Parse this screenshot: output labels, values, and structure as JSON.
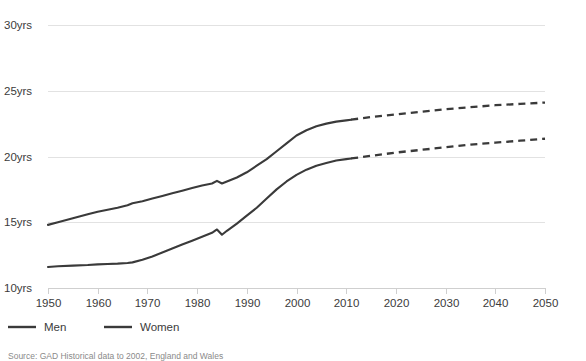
{
  "chart_data": {
    "type": "line",
    "title": "",
    "subtitle": "",
    "xlabel": "",
    "ylabel": "",
    "xlim": [
      1950,
      2050
    ],
    "ylim": [
      10,
      30
    ],
    "grid": true,
    "legend_position": "bottom-left",
    "y_tick_labels": [
      "10yrs",
      "15yrs",
      "20yrs",
      "25yrs",
      "30yrs"
    ],
    "y_ticks": [
      10,
      15,
      20,
      25,
      30
    ],
    "x_tick_labels": [
      "1950",
      "1960",
      "1970",
      "1980",
      "1990",
      "2000",
      "2010",
      "2020",
      "2030",
      "2040",
      "2050"
    ],
    "x_ticks": [
      1950,
      1960,
      1970,
      1980,
      1990,
      2000,
      2010,
      2020,
      2030,
      2040,
      2050
    ],
    "projection_start_year": 2011,
    "line_color": "#3a3a3a",
    "grid_color": "#e2e2e2",
    "series": [
      {
        "name": "Men",
        "style": "solid-then-dashed",
        "x": [
          1950,
          1952,
          1955,
          1958,
          1960,
          1962,
          1964,
          1966,
          1967,
          1969,
          1971,
          1973,
          1975,
          1977,
          1979,
          1981,
          1983,
          1984,
          1985,
          1986,
          1988,
          1990,
          1992,
          1994,
          1996,
          1998,
          2000,
          2002,
          2004,
          2006,
          2008,
          2010,
          2011
        ],
        "y": [
          11.6,
          11.65,
          11.7,
          11.75,
          11.8,
          11.82,
          11.85,
          11.9,
          11.95,
          12.15,
          12.4,
          12.7,
          13.0,
          13.3,
          13.6,
          13.9,
          14.2,
          14.45,
          14.05,
          14.35,
          14.9,
          15.5,
          16.1,
          16.8,
          17.5,
          18.1,
          18.6,
          19.0,
          19.3,
          19.5,
          19.7,
          19.8,
          19.85
        ],
        "x_projected": [
          2011,
          2015,
          2020,
          2025,
          2030,
          2035,
          2040,
          2045,
          2050
        ],
        "y_projected": [
          19.85,
          20.05,
          20.3,
          20.5,
          20.7,
          20.9,
          21.05,
          21.2,
          21.35
        ]
      },
      {
        "name": "Women",
        "style": "solid-then-dashed",
        "x": [
          1950,
          1952,
          1955,
          1958,
          1960,
          1962,
          1964,
          1966,
          1967,
          1969,
          1971,
          1973,
          1975,
          1977,
          1979,
          1981,
          1983,
          1984,
          1985,
          1986,
          1988,
          1990,
          1992,
          1994,
          1996,
          1998,
          2000,
          2002,
          2004,
          2006,
          2008,
          2010,
          2011
        ],
        "y": [
          14.8,
          15.0,
          15.3,
          15.6,
          15.8,
          15.95,
          16.1,
          16.3,
          16.45,
          16.6,
          16.8,
          17.0,
          17.2,
          17.4,
          17.6,
          17.8,
          17.95,
          18.15,
          17.95,
          18.1,
          18.4,
          18.8,
          19.3,
          19.8,
          20.4,
          21.0,
          21.6,
          22.0,
          22.3,
          22.5,
          22.65,
          22.75,
          22.8
        ],
        "x_projected": [
          2011,
          2015,
          2020,
          2025,
          2030,
          2035,
          2040,
          2045,
          2050
        ],
        "y_projected": [
          22.8,
          23.0,
          23.2,
          23.4,
          23.6,
          23.75,
          23.9,
          24.0,
          24.1
        ]
      }
    ]
  },
  "legend": {
    "items": [
      {
        "label": "Men"
      },
      {
        "label": "Women"
      }
    ]
  },
  "source": {
    "text": "Source:  GAD Historical data to 2002, England and Wales"
  }
}
